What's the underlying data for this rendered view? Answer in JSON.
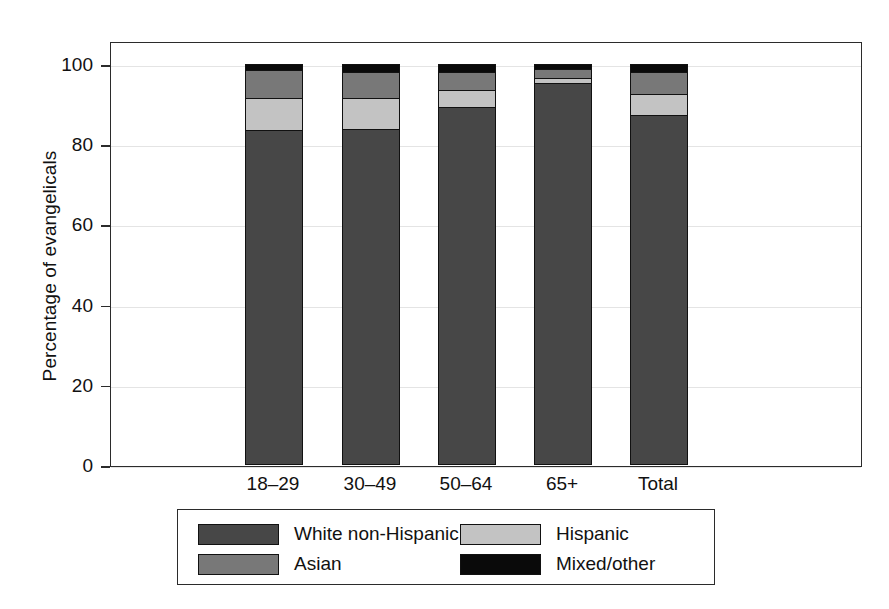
{
  "chart_data": {
    "type": "bar",
    "subtype": "stacked-bar-100",
    "title": "",
    "xlabel": "",
    "ylabel": "Percentage of evangelicals",
    "categories": [
      "18–29",
      "30–49",
      "50–64",
      "65+",
      "Total"
    ],
    "series": [
      {
        "name": "White non-Hispanic",
        "color": "#474747",
        "values": [
          83.5,
          83.8,
          89.2,
          95.3,
          87.2
        ]
      },
      {
        "name": "Hispanic",
        "color": "#c3c3c3",
        "values": [
          8.0,
          7.7,
          4.2,
          1.3,
          5.4
        ]
      },
      {
        "name": "Asian",
        "color": "#787878",
        "values": [
          7.1,
          6.6,
          4.6,
          2.1,
          5.5
        ]
      },
      {
        "name": "Mixed/other",
        "color": "#0a0a0a",
        "values": [
          1.4,
          1.9,
          2.0,
          1.3,
          1.9
        ]
      }
    ],
    "stack_order_bottom_to_top": [
      "White non-Hispanic",
      "Hispanic",
      "Asian",
      "Mixed/other"
    ],
    "yticks": [
      0,
      20,
      40,
      60,
      80,
      100
    ],
    "ylim": [
      0,
      100
    ],
    "grid": true,
    "grid_axis": "y",
    "legend_position": "below-axes",
    "legend_columns": 2
  },
  "axes": {
    "ylabel": "Percentage of evangelicals",
    "ytick_labels": [
      "100",
      "80",
      "60",
      "40",
      "20",
      "0"
    ],
    "xtick_labels": [
      "18–29",
      "30–49",
      "50–64",
      "65+",
      "Total"
    ]
  },
  "legend": {
    "entries": [
      {
        "label": "White non-Hispanic",
        "color": "#474747"
      },
      {
        "label": "Hispanic",
        "color": "#c3c3c3"
      },
      {
        "label": "Asian",
        "color": "#787878"
      },
      {
        "label": "Mixed/other",
        "color": "#0a0a0a"
      }
    ]
  },
  "colors": {
    "white_non_hispanic": "#474747",
    "asian": "#787878",
    "hispanic": "#c3c3c3",
    "mixed_other": "#0a0a0a",
    "axis": "#2b2b2b",
    "grid": "#e4e4e4",
    "background": "#ffffff"
  }
}
